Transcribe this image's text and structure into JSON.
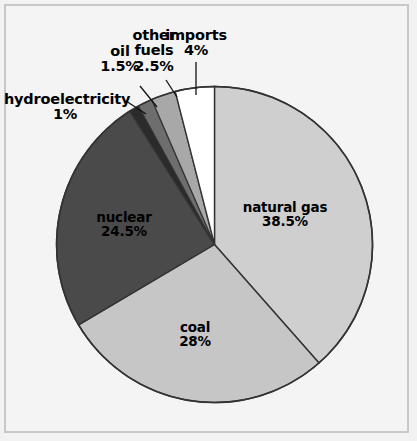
{
  "chart_data": {
    "type": "pie",
    "title": "",
    "categories": [
      "natural gas",
      "coal",
      "nuclear",
      "hydroelectricity",
      "oil",
      "other fuels",
      "imports"
    ],
    "values": [
      38.5,
      28,
      24.5,
      1,
      1.5,
      2.5,
      4
    ],
    "value_labels": [
      "38.5%",
      "28%",
      "24.5%",
      "1%",
      "1.5%",
      "2.5%",
      "4%"
    ],
    "unit": "%",
    "total": 100,
    "start_angle_deg": 0,
    "direction": "clockwise",
    "legend": "none",
    "grid": false,
    "slice_colors": [
      "#cfcfcf",
      "#c6c6c6",
      "#4a4a4a",
      "#2b2b2b",
      "#6e6e6e",
      "#a8a8a8",
      "#ffffff"
    ],
    "slices": [
      {
        "name": "natural gas",
        "value": 38.5,
        "label": "natural gas",
        "pct_label": "38.5%",
        "color": "#cfcfcf",
        "label_placement": "inside"
      },
      {
        "name": "coal",
        "value": 28,
        "label": "coal",
        "pct_label": "28%",
        "color": "#c6c6c6",
        "label_placement": "inside"
      },
      {
        "name": "nuclear",
        "value": 24.5,
        "label": "nuclear",
        "pct_label": "24.5%",
        "color": "#4a4a4a",
        "label_placement": "inside"
      },
      {
        "name": "hydroelectricity",
        "value": 1,
        "label": "hydroelectricity",
        "pct_label": "1%",
        "color": "#2b2b2b",
        "label_placement": "outside-leader"
      },
      {
        "name": "oil",
        "value": 1.5,
        "label": "oil",
        "pct_label": "1.5%",
        "color": "#6e6e6e",
        "label_placement": "outside-leader"
      },
      {
        "name": "other fuels",
        "value": 2.5,
        "label_line1": "other",
        "label_line2": "fuels",
        "label": "other fuels",
        "pct_label": "2.5%",
        "color": "#a8a8a8",
        "label_placement": "outside-leader"
      },
      {
        "name": "imports",
        "value": 4,
        "label": "imports",
        "pct_label": "4%",
        "color": "#ffffff",
        "label_placement": "outside-leader"
      }
    ]
  },
  "colors": {
    "background": "#f4f4f4",
    "frame": "#c8c8c8",
    "outline": "#333333",
    "text": "#000000"
  }
}
